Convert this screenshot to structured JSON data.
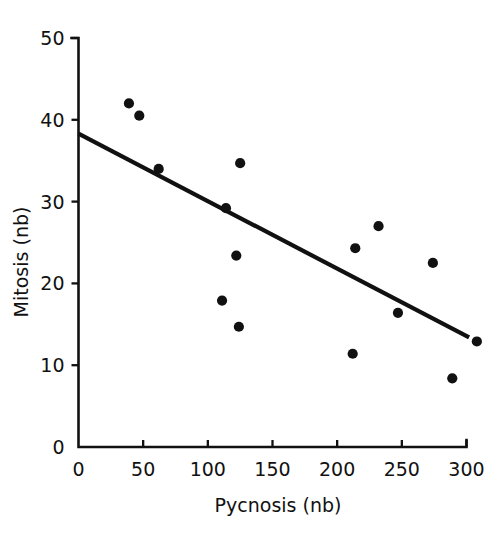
{
  "chart_data": {
    "type": "scatter",
    "title": "",
    "xlabel": "Pycnosis (nb)",
    "ylabel": "Mitosis (nb)",
    "xlim": [
      0,
      300
    ],
    "ylim": [
      0,
      50
    ],
    "xticks": [
      0,
      50,
      100,
      150,
      200,
      250,
      300
    ],
    "yticks": [
      0,
      10,
      20,
      30,
      40,
      50
    ],
    "xtick_labels": [
      "0",
      "50",
      "100",
      "150",
      "200",
      "250",
      "300"
    ],
    "ytick_labels": [
      "0",
      "10",
      "20",
      "30",
      "40",
      "50"
    ],
    "grid": false,
    "legend": null,
    "point_color": "#111111",
    "line_color": "#111111",
    "marker": "filled-circle",
    "points": [
      {
        "x": 39,
        "y": 42.0
      },
      {
        "x": 47,
        "y": 40.5
      },
      {
        "x": 62,
        "y": 34.0
      },
      {
        "x": 114,
        "y": 29.2
      },
      {
        "x": 111,
        "y": 17.9
      },
      {
        "x": 122,
        "y": 23.4
      },
      {
        "x": 124,
        "y": 14.7
      },
      {
        "x": 125,
        "y": 34.7
      },
      {
        "x": 212,
        "y": 11.4
      },
      {
        "x": 214,
        "y": 24.3
      },
      {
        "x": 232,
        "y": 27.0
      },
      {
        "x": 247,
        "y": 16.4
      },
      {
        "x": 274,
        "y": 22.5
      },
      {
        "x": 289,
        "y": 8.4
      },
      {
        "x": 308,
        "y": 12.9
      }
    ],
    "series": [
      {
        "name": "regression-line",
        "type": "line",
        "x": [
          0,
          302
        ],
        "y": [
          38.3,
          13.4
        ]
      }
    ]
  },
  "axes": {
    "x_axis_name": "Pycnosis (nb)",
    "y_axis_name": "Mitosis (nb)"
  }
}
